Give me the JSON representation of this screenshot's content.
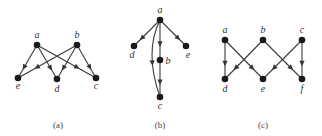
{
  "colors": {
    "edge": "#3a3a3a",
    "node": "#1a1a1a",
    "text": "#333333",
    "background": "#ffffff"
  },
  "graphs": [
    {
      "id": "a",
      "caption": "(a)",
      "caption_pos": [
        58,
        128
      ],
      "nodes": [
        {
          "id": "a",
          "label": "a",
          "x": 37,
          "y": 45,
          "lx": 37,
          "ly": 38
        },
        {
          "id": "b",
          "label": "b",
          "x": 77,
          "y": 45,
          "lx": 77,
          "ly": 38
        },
        {
          "id": "e",
          "label": "e",
          "x": 18,
          "y": 78,
          "lx": 18,
          "ly": 89
        },
        {
          "id": "d",
          "label": "d",
          "x": 57,
          "y": 79,
          "lx": 57,
          "ly": 92
        },
        {
          "id": "c",
          "label": "c",
          "x": 96,
          "y": 78,
          "lx": 96,
          "ly": 89
        }
      ],
      "edges": [
        {
          "from": "a",
          "to": "e",
          "t": 0.68
        },
        {
          "from": "a",
          "to": "d",
          "t": 0.68
        },
        {
          "from": "a",
          "to": "c",
          "t": 0.68
        },
        {
          "from": "b",
          "to": "e",
          "t": 0.68
        },
        {
          "from": "b",
          "to": "d",
          "t": 0.68
        },
        {
          "from": "b",
          "to": "c",
          "t": 0.68
        }
      ]
    },
    {
      "id": "b",
      "caption": "(b)",
      "caption_pos": [
        160,
        128
      ],
      "nodes": [
        {
          "id": "a",
          "label": "a",
          "x": 160,
          "y": 20,
          "lx": 160,
          "ly": 13
        },
        {
          "id": "d",
          "label": "d",
          "x": 134,
          "y": 46,
          "lx": 132,
          "ly": 58
        },
        {
          "id": "e",
          "label": "e",
          "x": 186,
          "y": 46,
          "lx": 188,
          "ly": 58
        },
        {
          "id": "b",
          "label": "b",
          "x": 160,
          "y": 60,
          "lx": 168,
          "ly": 64
        },
        {
          "id": "c",
          "label": "c",
          "x": 160,
          "y": 97,
          "lx": 160,
          "ly": 109
        }
      ],
      "edges": [
        {
          "from": "a",
          "to": "d",
          "t": 0.7
        },
        {
          "from": "a",
          "to": "e",
          "t": 0.7
        },
        {
          "from": "a",
          "to": "b",
          "t": 0.6
        },
        {
          "from": "b",
          "to": "c",
          "t": 0.6
        },
        {
          "from": "a",
          "to": "c",
          "curve": [
            144,
            52
          ],
          "t": 0.6
        }
      ]
    },
    {
      "id": "c",
      "caption": "(c)",
      "caption_pos": [
        263,
        128
      ],
      "nodes": [
        {
          "id": "a",
          "label": "a",
          "x": 225,
          "y": 40,
          "lx": 225,
          "ly": 33
        },
        {
          "id": "b",
          "label": "b",
          "x": 263,
          "y": 40,
          "lx": 263,
          "ly": 33
        },
        {
          "id": "c",
          "label": "c",
          "x": 302,
          "y": 40,
          "lx": 302,
          "ly": 33
        },
        {
          "id": "d",
          "label": "d",
          "x": 225,
          "y": 79,
          "lx": 225,
          "ly": 92
        },
        {
          "id": "e",
          "label": "e",
          "x": 263,
          "y": 79,
          "lx": 263,
          "ly": 92
        },
        {
          "id": "f",
          "label": "f",
          "x": 302,
          "y": 79,
          "lx": 302,
          "ly": 92
        }
      ],
      "edges": [
        {
          "from": "a",
          "to": "d",
          "t": 0.6
        },
        {
          "from": "a",
          "to": "e",
          "t": 0.72
        },
        {
          "from": "b",
          "to": "d",
          "t": 0.72
        },
        {
          "from": "b",
          "to": "f",
          "t": 0.72
        },
        {
          "from": "c",
          "to": "e",
          "t": 0.72
        },
        {
          "from": "c",
          "to": "f",
          "t": 0.6
        }
      ]
    }
  ]
}
